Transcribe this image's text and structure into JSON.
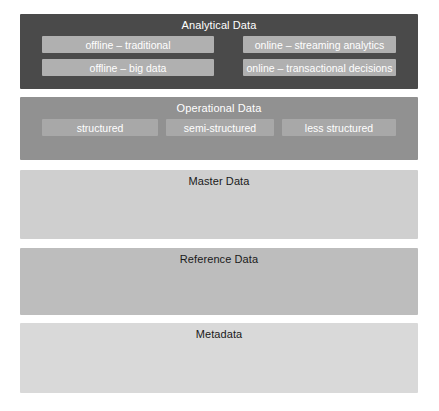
{
  "diagram": {
    "background_color": "#ffffff",
    "layers": [
      {
        "id": "analytical",
        "label": "Analytical Data",
        "fill": "#4a4a4a",
        "text_color": "#ffffff",
        "sub_box_fill": "#b0b0b0",
        "sub_boxes": [
          {
            "label": "offline – traditional"
          },
          {
            "label": "online – streaming analytics"
          },
          {
            "label": "offline – big data"
          },
          {
            "label": "online – transactional decisions"
          }
        ]
      },
      {
        "id": "operational",
        "label": "Operational Data",
        "fill": "#919191",
        "text_color": "#ffffff",
        "sub_box_fill": "#a8a8a8",
        "sub_boxes": [
          {
            "label": "structured"
          },
          {
            "label": "semi-structured"
          },
          {
            "label": "less structured"
          }
        ]
      },
      {
        "id": "master",
        "label": "Master Data",
        "fill": "#cfcfcf",
        "text_color": "#1a1a1a",
        "sub_boxes": []
      },
      {
        "id": "reference",
        "label": "Reference Data",
        "fill": "#bdbdbd",
        "text_color": "#1a1a1a",
        "sub_boxes": []
      },
      {
        "id": "metadata",
        "label": "Metadata",
        "fill": "#d9d9d9",
        "text_color": "#1a1a1a",
        "sub_boxes": []
      }
    ]
  }
}
